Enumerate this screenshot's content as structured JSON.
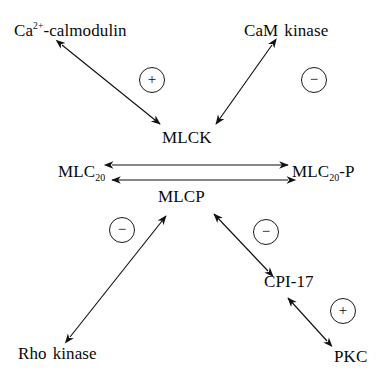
{
  "diagram": {
    "background_color": "#ffffff",
    "stroke_color": "#111111",
    "text_color": "#0a0a0a",
    "width": 391,
    "height": 376,
    "nodes": [
      {
        "id": "ca_calmodulin",
        "text_main": "Ca",
        "superscript": "2+",
        "text_tail": "-calmodulin",
        "x": 14,
        "y": 22
      },
      {
        "id": "cam_kinase",
        "text_main": "CaM",
        "text_tail": "kinase",
        "x": 244,
        "y": 22
      },
      {
        "id": "mlck",
        "text_main": "MLCK",
        "x": 162,
        "y": 129
      },
      {
        "id": "mlc20",
        "text_main": "MLC",
        "subscript": "20",
        "x": 58,
        "y": 163
      },
      {
        "id": "mlc20p",
        "text_main": "MLC",
        "subscript": "20",
        "text_tail": "-P",
        "x": 292,
        "y": 163
      },
      {
        "id": "mlcp",
        "text_main": "MLCP",
        "x": 158,
        "y": 188
      },
      {
        "id": "cpi17",
        "text_main": "CPI-17",
        "x": 264,
        "y": 273
      },
      {
        "id": "rho_kinase",
        "text_main": "Rho",
        "text_tail": "kinase",
        "x": 18,
        "y": 345
      },
      {
        "id": "pkc",
        "text_main": "PKC",
        "x": 334,
        "y": 348
      }
    ],
    "signs": [
      {
        "id": "sign-activate-mlck",
        "symbol": "+",
        "meaning": "activation",
        "cx": 152,
        "cy": 80
      },
      {
        "id": "sign-inhibit-mlck",
        "symbol": "−",
        "meaning": "inhibition",
        "cx": 314,
        "cy": 80
      },
      {
        "id": "sign-inhibit-mlcp-left",
        "symbol": "−",
        "meaning": "inhibition",
        "cx": 122,
        "cy": 230
      },
      {
        "id": "sign-inhibit-mlcp-right",
        "symbol": "−",
        "meaning": "inhibition",
        "cx": 266,
        "cy": 232
      },
      {
        "id": "sign-activate-cpi17",
        "symbol": "+",
        "meaning": "activation",
        "cx": 343,
        "cy": 311
      }
    ],
    "edges": [
      {
        "id": "edge-ca-calmodulin-to-mlck",
        "from": "ca_calmodulin",
        "to": "mlck",
        "style": "double-headed",
        "x1": 62,
        "y1": 45,
        "x2": 160,
        "y2": 124
      },
      {
        "id": "edge-cam-kinase-to-mlck",
        "from": "cam_kinase",
        "to": "mlck",
        "style": "double-headed",
        "x1": 272,
        "y1": 45,
        "x2": 216,
        "y2": 124
      },
      {
        "id": "edge-mlc20-to-mlc20p-forward",
        "from": "mlc20",
        "to": "mlc20p",
        "style": "double-headed",
        "x1": 112,
        "y1": 165,
        "x2": 288,
        "y2": 165
      },
      {
        "id": "edge-mlc20p-to-mlc20-reverse",
        "from": "mlc20p",
        "to": "mlc20",
        "style": "double-headed",
        "x1": 288,
        "y1": 180,
        "x2": 112,
        "y2": 180
      },
      {
        "id": "edge-rho-kinase-to-mlcp",
        "from": "rho_kinase",
        "to": "mlcp",
        "style": "double-headed",
        "x1": 70,
        "y1": 337,
        "x2": 166,
        "y2": 216
      },
      {
        "id": "edge-cpi17-to-mlcp",
        "from": "cpi17",
        "to": "mlcp",
        "style": "double-headed",
        "x1": 268,
        "y1": 271,
        "x2": 214,
        "y2": 214
      },
      {
        "id": "edge-pkc-to-cpi17",
        "from": "pkc",
        "to": "cpi17",
        "style": "double-headed",
        "x1": 327,
        "y1": 341,
        "x2": 288,
        "y2": 298
      }
    ]
  }
}
